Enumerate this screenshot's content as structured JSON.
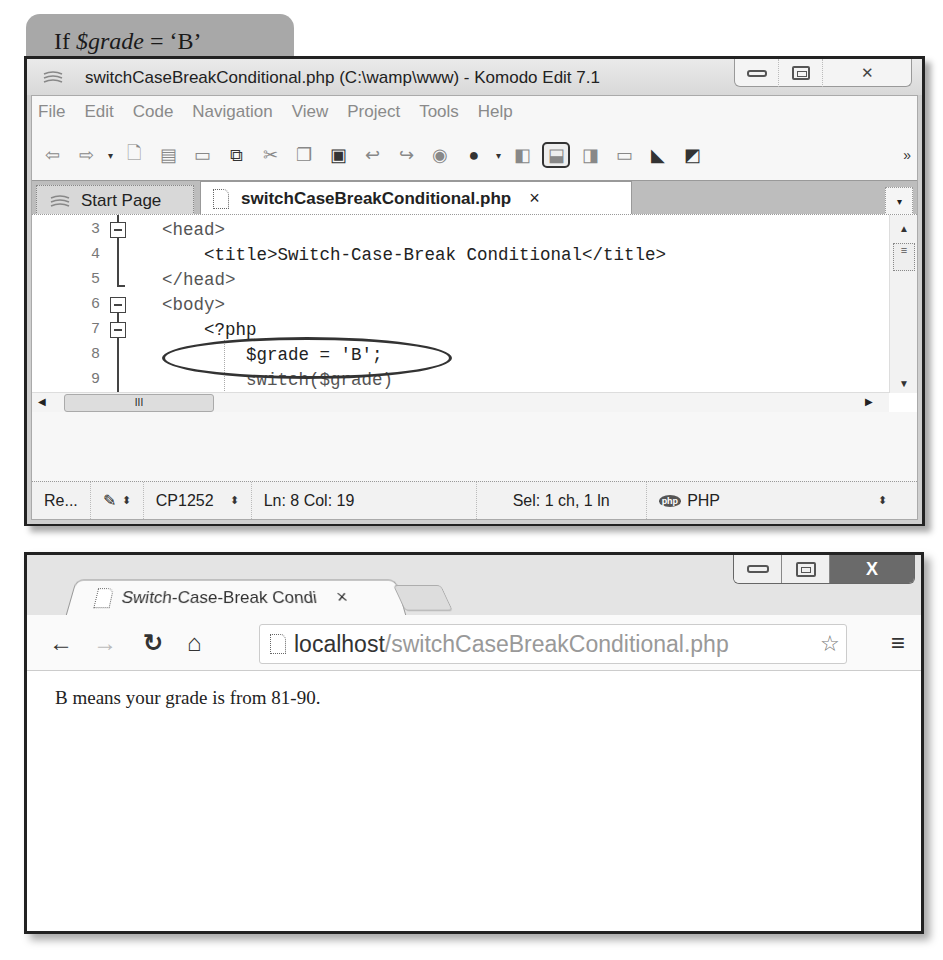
{
  "figure_label": {
    "prefix": "If ",
    "variable": "$grade",
    "suffix": " = ‘B’"
  },
  "komodo": {
    "title": "switchCaseBreakConditional.php (C:\\wamp\\www) - Komodo Edit 7.1",
    "window_controls": {
      "minimize": "minimize",
      "maximize": "maximize",
      "close": "✕"
    },
    "menu": [
      "File",
      "Edit",
      "Code",
      "Navigation",
      "View",
      "Project",
      "Tools",
      "Help"
    ],
    "toolbar_icons": [
      "back-icon",
      "forward-icon",
      "history-dropdown",
      "new-file-icon",
      "open-file-icon",
      "save-icon",
      "save-all-icon",
      "cut-icon",
      "copy-icon",
      "paste-icon",
      "undo-icon",
      "redo-icon",
      "browser-preview-icon",
      "run-icon",
      "toggle-left-pane-icon",
      "toggle-bottom-pane-icon",
      "toggle-right-pane-icon",
      "workspace-icon",
      "komodo-resources-icon",
      "screen-icon"
    ],
    "tabs": [
      {
        "label": "Start Page",
        "active": false
      },
      {
        "label": "switchCaseBreakConditional.php",
        "active": true,
        "close": "×"
      }
    ],
    "code_lines": [
      {
        "num": "3",
        "text": "<head>",
        "fold": "open"
      },
      {
        "num": "4",
        "text": "    <title>Switch-Case-Break Conditional</title>",
        "fold": ""
      },
      {
        "num": "5",
        "text": "</head>",
        "fold": "end"
      },
      {
        "num": "6",
        "text": "<body>",
        "fold": "open"
      },
      {
        "num": "7",
        "text": "    <?php",
        "fold": "open"
      },
      {
        "num": "8",
        "text": "        $grade = 'B';",
        "fold": ""
      },
      {
        "num": "9",
        "text": "        switch($grade)",
        "fold": ""
      }
    ],
    "hscroll_grip": "III",
    "status": {
      "mode": "Re...",
      "encoding": "CP1252",
      "position": "Ln: 8 Col: 19",
      "selection": "Sel: 1 ch, 1 ln",
      "language_badge": "php",
      "language": "PHP"
    }
  },
  "browser": {
    "tab_title": "Switch-Case-Break Condi",
    "tab_close": "×",
    "close_glyph": "X",
    "url_host": "localhost",
    "url_path": "/switchCaseBreakConditional.php",
    "page_text": "B means your grade is from 81-90."
  }
}
